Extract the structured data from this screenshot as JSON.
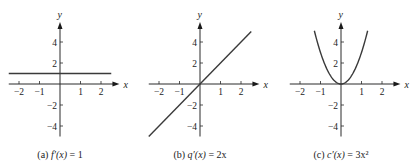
{
  "chart_data": [
    {
      "type": "line",
      "panel": "a",
      "title": "(a) f′(x) = 1",
      "caption_prefix": "(a) ",
      "caption_func": "f′(x)",
      "caption_rhs": " = 1",
      "xlabel": "x",
      "ylabel": "y",
      "xlim": [
        -2.5,
        2.7
      ],
      "ylim": [
        -5,
        5
      ],
      "xticks": [
        -2,
        -1,
        1,
        2
      ],
      "xtick_labels": [
        "−2",
        "−1",
        "1",
        "2"
      ],
      "yticks": [
        -4,
        -2,
        2,
        4
      ],
      "ytick_labels": [
        "−4",
        "−2",
        "2",
        "4"
      ],
      "grid": false,
      "series": [
        {
          "name": "f′(x) = 1",
          "expr": "constant",
          "x": [
            -2.5,
            2.5
          ],
          "y": [
            1,
            1
          ]
        }
      ]
    },
    {
      "type": "line",
      "panel": "b",
      "title": "(b) q′(x) = 2x",
      "caption_prefix": "(b) ",
      "caption_func": "q′(x)",
      "caption_rhs": " = 2x",
      "xlabel": "x",
      "ylabel": "y",
      "xlim": [
        -2.5,
        2.7
      ],
      "ylim": [
        -5,
        5
      ],
      "xticks": [
        -2,
        -1,
        1,
        2
      ],
      "xtick_labels": [
        "−2",
        "−1",
        "1",
        "2"
      ],
      "yticks": [
        -4,
        -2,
        2,
        4
      ],
      "ytick_labels": [
        "−4",
        "−2",
        "2",
        "4"
      ],
      "grid": false,
      "series": [
        {
          "name": "q′(x) = 2x",
          "expr": "linear",
          "x": [
            -2.5,
            2.5
          ],
          "y": [
            -5,
            5
          ]
        }
      ]
    },
    {
      "type": "line",
      "panel": "c",
      "title": "(c) c′(x) = 3x²",
      "caption_prefix": "(c) ",
      "caption_func": "c′(x)",
      "caption_rhs": " = 3x²",
      "xlabel": "x",
      "ylabel": "y",
      "xlim": [
        -2.5,
        2.7
      ],
      "ylim": [
        -5,
        5
      ],
      "xticks": [
        -2,
        -1,
        1,
        2
      ],
      "xtick_labels": [
        "−2",
        "−1",
        "1",
        "2"
      ],
      "yticks": [
        -4,
        -2,
        2,
        4
      ],
      "ytick_labels": [
        "−4",
        "−2",
        "2",
        "4"
      ],
      "grid": false,
      "series": [
        {
          "name": "c′(x) = 3x²",
          "expr": "quadratic",
          "x": [
            -1.3,
            -1.0,
            -0.5,
            0,
            0.5,
            1.0,
            1.3
          ],
          "y": [
            5.07,
            3,
            0.75,
            0,
            0.75,
            3,
            5.07
          ]
        }
      ]
    }
  ],
  "layout": {
    "panels": [
      {
        "origin_x": 60,
        "origin_y": 84
      },
      {
        "origin_x": 200,
        "origin_y": 84
      },
      {
        "origin_x": 341,
        "origin_y": 84
      }
    ],
    "x_scale": 20.5,
    "y_scale": 10.5,
    "x_axis_left": -2.5,
    "x_axis_right": 2.9,
    "y_axis_top": 5.9,
    "y_axis_bottom": -5.0,
    "caption_y": 158
  }
}
